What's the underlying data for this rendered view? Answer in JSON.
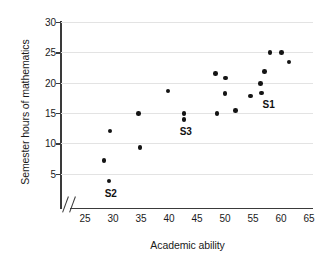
{
  "chart_data": {
    "type": "scatter",
    "title": "",
    "xlabel": "Academic ability",
    "ylabel": "Semester hours of mathematics",
    "xlim": [
      25,
      65
    ],
    "ylim": [
      0,
      30
    ],
    "xticks": [
      25,
      30,
      35,
      40,
      45,
      50,
      55,
      60,
      65
    ],
    "yticks": [
      5,
      10,
      15,
      20,
      25,
      30
    ],
    "grid": "horizontal",
    "legend": null,
    "axis_break": "x-axis break between origin and 25",
    "points": [
      {
        "x": 28.4,
        "y": 7.2
      },
      {
        "x": 29.3,
        "y": 3.8,
        "label": "S2"
      },
      {
        "x": 29.5,
        "y": 12.0
      },
      {
        "x": 34.8,
        "y": 9.3
      },
      {
        "x": 34.6,
        "y": 14.9
      },
      {
        "x": 39.8,
        "y": 18.6
      },
      {
        "x": 42.7,
        "y": 14.9,
        "label": "S3"
      },
      {
        "x": 42.7,
        "y": 13.9
      },
      {
        "x": 48.3,
        "y": 21.5
      },
      {
        "x": 48.6,
        "y": 14.9
      },
      {
        "x": 50.1,
        "y": 20.8
      },
      {
        "x": 50.0,
        "y": 18.2
      },
      {
        "x": 51.9,
        "y": 15.4
      },
      {
        "x": 54.6,
        "y": 17.8
      },
      {
        "x": 56.5,
        "y": 18.3,
        "label": "S1"
      },
      {
        "x": 56.3,
        "y": 19.9
      },
      {
        "x": 57.1,
        "y": 21.8
      },
      {
        "x": 58.0,
        "y": 25.0
      },
      {
        "x": 60.1,
        "y": 25.0
      },
      {
        "x": 61.4,
        "y": 23.4
      }
    ],
    "annotations": [
      {
        "text": "S1",
        "x": 57.8,
        "y": 16.4
      },
      {
        "text": "S2",
        "x": 29.6,
        "y": 1.6
      },
      {
        "text": "S3",
        "x": 43.0,
        "y": 11.8
      }
    ],
    "colors": {
      "point": "#141414",
      "axis": "#3a3a3a",
      "gridline": "#e3e3e3",
      "background": "#ffffff",
      "text": "#1a1a1a"
    }
  }
}
